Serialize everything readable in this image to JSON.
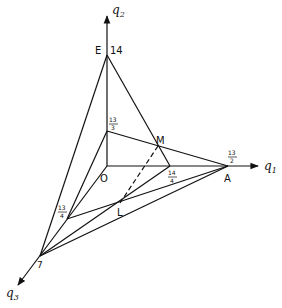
{
  "diagram": {
    "axes": {
      "q1": {
        "label": "q",
        "sub": "1"
      },
      "q2": {
        "label": "q",
        "sub": "2"
      },
      "q3": {
        "label": "q",
        "sub": "3"
      }
    },
    "points": {
      "O": "O",
      "E": "E",
      "A": "A",
      "M": "M",
      "L": "L"
    },
    "ticks": {
      "q2_top": "14",
      "q2_mid_num": "13",
      "q2_mid_den": "3",
      "q1_far_num": "13",
      "q1_far_den": "2",
      "q1_mid_num": "14",
      "q1_mid_den": "4",
      "q3_mid_num": "13",
      "q3_mid_den": "4",
      "q3_far": "7"
    }
  }
}
